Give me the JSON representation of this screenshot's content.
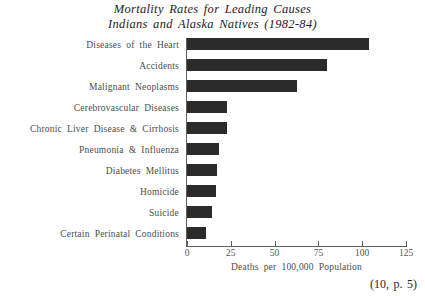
{
  "chart_data": {
    "type": "bar",
    "orientation": "horizontal",
    "title": "Mortality Rates for Leading Causes Indians and Alaska Natives (1982-84)",
    "title_lines": [
      "Mortality Rates for Leading Causes",
      "Indians and Alaska Natives (1982-84)"
    ],
    "categories": [
      "Diseases of the Heart",
      "Accidents",
      "Malignant Neoplasms",
      "Cerebrovascular Diseases",
      "Chronic Liver Disease & Cirrhosis",
      "Pneumonia & Influenza",
      "Diabetes Mellitus",
      "Homicide",
      "Suicide",
      "Certain Perinatal Conditions"
    ],
    "values": [
      104,
      80,
      63,
      23,
      23,
      18,
      17,
      16.5,
      14,
      11
    ],
    "xlabel": "Deaths per 100,000 Population",
    "ylabel": "",
    "xlim": [
      0,
      125
    ],
    "xticks": [
      0,
      25,
      50,
      75,
      100,
      125
    ],
    "xtick_labels": [
      "0",
      "25",
      "50",
      "75",
      "100",
      "125"
    ],
    "grid": false,
    "legend": false,
    "bar_color": "#2b2b2b",
    "axis_color": "#5d5d5d",
    "text_color": "#4d4d4d"
  },
  "citation": "(10, p. 5)"
}
